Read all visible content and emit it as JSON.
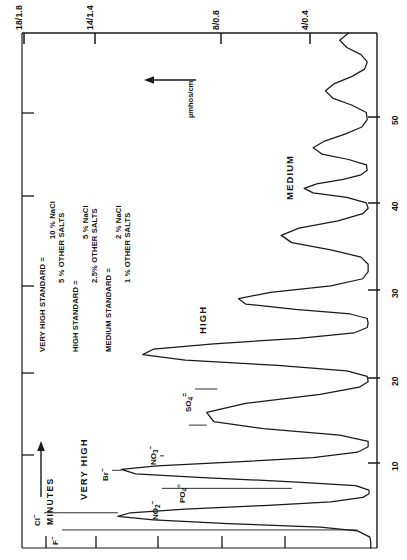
{
  "figure": {
    "axes": {
      "conductivity_axis": {
        "unit_label": "µmhos/cm",
        "tick_labels": [
          "18/1.8",
          "14/1.4",
          "8/0.8",
          "4/0.4"
        ],
        "tick_values": [
          18,
          14,
          8,
          4
        ]
      },
      "time_axis": {
        "name": "MINUTES",
        "tick_labels": [
          "10",
          "20",
          "30",
          "40",
          "50"
        ],
        "tick_values": [
          10,
          20,
          30,
          40,
          50
        ],
        "unit": "minutes"
      }
    },
    "band_labels": [
      {
        "text": "VERY HIGH"
      },
      {
        "text": "HIGH"
      },
      {
        "text": "MEDIUM"
      }
    ],
    "ion_labels": [
      {
        "text": "F⁻",
        "base": "F",
        "sup": "–"
      },
      {
        "text": "Cl⁻",
        "base": "Cl",
        "sup": "–"
      },
      {
        "text": "NO₂⁻",
        "base": "NO",
        "sub": "2",
        "sup": "–"
      },
      {
        "text": "Br⁻",
        "base": "Br",
        "sup": "–"
      },
      {
        "text": "NO₃⁻",
        "base": "NO",
        "sub": "3",
        "sup": "–"
      },
      {
        "text": "PO₄³⁻",
        "base": "PO",
        "sub": "4",
        "sup": "≡"
      },
      {
        "text": "SO₄²⁻",
        "base": "SO",
        "sub": "4",
        "sup": "="
      }
    ],
    "legend": {
      "rows": [
        {
          "name": "VERY HIGH STANDARD",
          "equals": "=",
          "values": [
            "10  % NaCl",
            "5  % OTHER SALTS"
          ]
        },
        {
          "name": "HIGH STANDARD",
          "equals": "=",
          "values": [
            "5  % NaCl",
            "2.5% OTHER SALTS"
          ]
        },
        {
          "name": "MEDIUM STANDARD",
          "equals": "=",
          "values": [
            "2  % NaCl",
            "1  % OTHER SALTS"
          ]
        }
      ]
    },
    "colors": {
      "trace": "#1a1a1a",
      "axis": "#1a1a1a",
      "background": "#ffffff"
    }
  },
  "chart_data": {
    "type": "line",
    "title": "",
    "orientation": "rotated-90",
    "xlabel": "MINUTES",
    "ylabel": "µmhos/cm",
    "xlim": [
      0,
      57
    ],
    "ylim": [
      0,
      20
    ],
    "grid": false,
    "legend_position": "upper-left-inside",
    "y_tick_values": [
      4,
      8,
      14,
      18
    ],
    "y_tick_labels": [
      "4/0.4",
      "8/0.8",
      "14/1.4",
      "18/1.8"
    ],
    "x_tick_values": [
      10,
      20,
      30,
      40,
      50
    ],
    "x_tick_labels": [
      "10",
      "20",
      "30",
      "40",
      "50"
    ],
    "series": [
      {
        "name": "chromatogram trace",
        "x": [
          0,
          0.6,
          1.2,
          1.9,
          2.3,
          2.7,
          3.1,
          3.5,
          3.9,
          4.3,
          4.7,
          5.1,
          5.6,
          6.0,
          6.4,
          6.9,
          7.3,
          7.8,
          8.2,
          8.7,
          9.1,
          9.5,
          10.0,
          10.6,
          11.2,
          11.8,
          12.5,
          13.2,
          14.0,
          15.0,
          16.0,
          17.0,
          17.8,
          18.4,
          19.0,
          19.6,
          20.2,
          20.8,
          21.4,
          22.0,
          22.6,
          23.2,
          23.8,
          24.4,
          24.9,
          25.4,
          25.9,
          26.4,
          27.0,
          27.6,
          28.3,
          29.0,
          29.8,
          30.6,
          31.4,
          32.2,
          33.0,
          33.8,
          34.6,
          35.4,
          36.2,
          37.0,
          37.6,
          38.2,
          38.8,
          39.3,
          39.8,
          40.3,
          40.8,
          41.3,
          41.8,
          42.4,
          43.0,
          43.6,
          44.3,
          45.0,
          45.8,
          46.6,
          47.4,
          48.2,
          49.0,
          49.8,
          50.6,
          51.4,
          52.2,
          53.0,
          53.8,
          54.6,
          55.4,
          56.2,
          57.0
        ],
        "y": [
          0.35,
          0.35,
          0.4,
          1.1,
          3.2,
          8.4,
          12.6,
          14.6,
          13.9,
          10.8,
          6.4,
          2.6,
          0.8,
          0.45,
          0.45,
          1.2,
          4.5,
          9.8,
          13.6,
          14.4,
          12.4,
          8.2,
          3.6,
          1.1,
          0.5,
          0.5,
          2.1,
          6.4,
          9.2,
          9.6,
          7.4,
          3.2,
          1.0,
          0.5,
          0.55,
          1.7,
          5.6,
          10.8,
          13.2,
          12.6,
          9.2,
          4.4,
          1.3,
          0.55,
          0.5,
          0.55,
          1.5,
          4.6,
          7.4,
          7.8,
          6.0,
          2.6,
          0.8,
          0.5,
          0.5,
          0.9,
          2.6,
          4.8,
          5.4,
          4.4,
          2.2,
          0.8,
          0.5,
          0.6,
          1.7,
          3.6,
          4.1,
          3.4,
          1.9,
          0.9,
          0.55,
          0.6,
          1.6,
          3.1,
          3.6,
          3.0,
          1.8,
          0.85,
          0.55,
          0.6,
          1.4,
          2.5,
          2.9,
          2.4,
          1.4,
          0.7,
          0.55,
          0.9,
          1.7,
          2.1,
          1.6
        ]
      }
    ],
    "peaks": [
      {
        "label": "F⁻",
        "time": 2.0,
        "height": 1.1,
        "band": "VERY HIGH"
      },
      {
        "label": "Cl⁻",
        "time": 3.9,
        "height": 14.6,
        "band": "VERY HIGH"
      },
      {
        "label": "NO₂⁻",
        "time": 6.6,
        "height": 4.8,
        "band": "VERY HIGH"
      },
      {
        "label": "Br⁻",
        "time": 8.6,
        "height": 14.4,
        "band": "VERY HIGH"
      },
      {
        "label": "NO₃⁻",
        "time": 10.2,
        "height": 12.0,
        "band": "VERY HIGH"
      },
      {
        "label": "PO₄³⁻",
        "time": 13.6,
        "height": 9.6,
        "band": "VERY HIGH"
      },
      {
        "label": "SO₄²⁻",
        "time": 17.6,
        "height": 9.0,
        "band": "VERY HIGH"
      }
    ]
  }
}
